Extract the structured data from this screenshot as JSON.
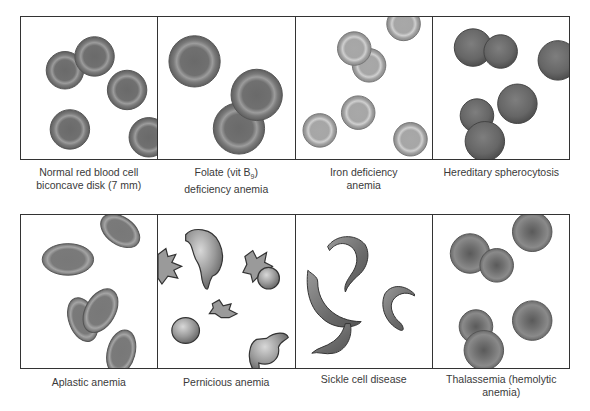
{
  "figure": {
    "top_row": [
      {
        "id": "normal",
        "caption_line1": "Normal red blood cell",
        "caption_line2": "biconcave disk (7 mm)"
      },
      {
        "id": "folate",
        "caption_line1_pre": "Folate (vit B",
        "caption_line1_sub": "9",
        "caption_line1_post": ")",
        "caption_line2": "deficiency anemia"
      },
      {
        "id": "iron",
        "caption_line1": "Iron deficiency",
        "caption_line2": "anemia"
      },
      {
        "id": "spherocytosis",
        "caption_line1": "Hereditary spherocytosis",
        "caption_line2": ""
      }
    ],
    "bottom_row": [
      {
        "id": "aplastic",
        "caption_line1": "Aplastic anemia",
        "caption_line2": ""
      },
      {
        "id": "pernicious",
        "caption_line1": "Pernicious anemia",
        "caption_line2": ""
      },
      {
        "id": "sickle",
        "caption_line1": "Sickle cell disease",
        "caption_line2": ""
      },
      {
        "id": "thalassemia",
        "caption_line1": "Thalassemia (hemolytic",
        "caption_line2": "anemia)"
      }
    ]
  },
  "colors": {
    "border": "#333333",
    "cell_dark": "#6e6e6e",
    "cell_ring": "#9a9a9a",
    "cell_light": "#b5b5b5",
    "caption": "#3a3a3a"
  }
}
